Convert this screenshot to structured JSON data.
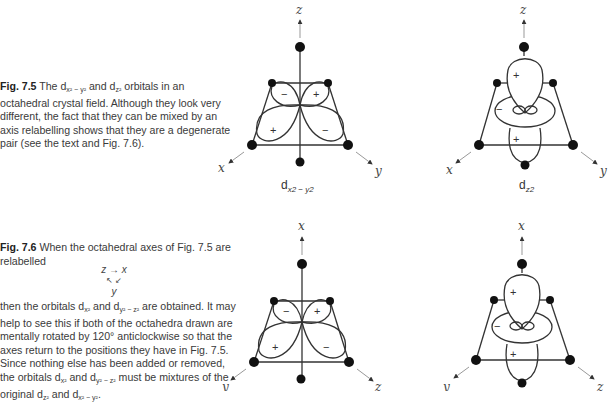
{
  "fig75": {
    "label": "Fig. 7.5",
    "text_a": " The d",
    "sub_a": "x² − y²",
    "text_b": " and d",
    "sub_b": "z²",
    "text_c": " orbitals in an octahedral crystal field. Although they look very different, the fact that they can be mixed by an axis relabelling shows that they are a degenerate pair (see the text and Fig. 7.6)."
  },
  "fig76": {
    "label": "Fig. 7.6",
    "text_a": " When the octahedral axes of Fig. 7.5 are relabelled",
    "relabel": {
      "top": "z → x",
      "arrows": "↖ ↙",
      "bottom": "y"
    },
    "para_a": "then the orbitals d",
    "para_sub_a": "x²",
    "para_b": " and d",
    "para_sub_b": "y² − z²",
    "para_c": " are obtained. It may help to see this if both of the octahedra drawn are mentally rotated by 120° anticlockwise so that the axes return to the positions they have in Fig. 7.5. Since nothing else has been added or removed, the orbitals d",
    "para_sub_c": "x²",
    "para_d": " and d",
    "para_sub_d": "y² − z²",
    "para_e": " must be mixtures of the original d",
    "para_sub_e": "z²",
    "para_f": " and d",
    "para_sub_f": "x² − y²",
    "para_g": "."
  },
  "diagrams": [
    {
      "id": "dx2y2",
      "axis_top": "z",
      "axis_left": "x",
      "axis_right": "y",
      "name": "d",
      "name_sub": "x2 − y2",
      "signs": [
        "−",
        "+",
        "+",
        "−"
      ]
    },
    {
      "id": "dz2",
      "axis_top": "z",
      "axis_left": "x",
      "axis_right": "y",
      "name": "d",
      "name_sub": "z2",
      "signs": [
        "+",
        "−",
        "+"
      ]
    },
    {
      "id": "dx2y2-relabelled",
      "axis_top": "x",
      "axis_left": "y",
      "axis_right": "z",
      "signs": [
        "−",
        "+",
        "+",
        "−"
      ]
    },
    {
      "id": "dz2-relabelled",
      "axis_top": "x",
      "axis_left": "y",
      "axis_right": "z",
      "signs": [
        "+",
        "−",
        "+"
      ]
    }
  ]
}
